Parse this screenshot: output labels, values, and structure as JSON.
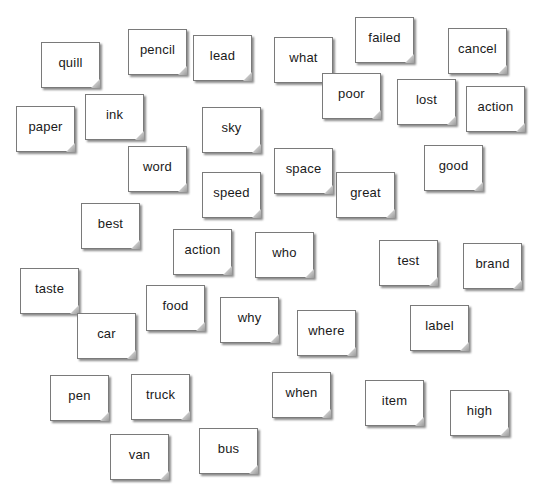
{
  "board": {
    "cards": [
      {
        "word": "quill",
        "x": 41,
        "y": 42
      },
      {
        "word": "pencil",
        "x": 128,
        "y": 29
      },
      {
        "word": "lead",
        "x": 193,
        "y": 35
      },
      {
        "word": "what",
        "x": 274,
        "y": 37
      },
      {
        "word": "failed",
        "x": 355,
        "y": 17
      },
      {
        "word": "cancel",
        "x": 448,
        "y": 28
      },
      {
        "word": "paper",
        "x": 16,
        "y": 106
      },
      {
        "word": "ink",
        "x": 85,
        "y": 94
      },
      {
        "word": "poor",
        "x": 322,
        "y": 73
      },
      {
        "word": "lost",
        "x": 397,
        "y": 79
      },
      {
        "word": "action",
        "x": 466,
        "y": 86
      },
      {
        "word": "sky",
        "x": 202,
        "y": 107
      },
      {
        "word": "word",
        "x": 128,
        "y": 146
      },
      {
        "word": "space",
        "x": 274,
        "y": 148
      },
      {
        "word": "good",
        "x": 424,
        "y": 145
      },
      {
        "word": "speed",
        "x": 202,
        "y": 172
      },
      {
        "word": "great",
        "x": 336,
        "y": 172
      },
      {
        "word": "best",
        "x": 81,
        "y": 203
      },
      {
        "word": "action",
        "x": 173,
        "y": 229
      },
      {
        "word": "who",
        "x": 255,
        "y": 232
      },
      {
        "word": "test",
        "x": 379,
        "y": 240
      },
      {
        "word": "brand",
        "x": 463,
        "y": 243
      },
      {
        "word": "taste",
        "x": 20,
        "y": 268
      },
      {
        "word": "food",
        "x": 146,
        "y": 285
      },
      {
        "word": "why",
        "x": 220,
        "y": 297
      },
      {
        "word": "car",
        "x": 77,
        "y": 313
      },
      {
        "word": "where",
        "x": 297,
        "y": 310
      },
      {
        "word": "label",
        "x": 410,
        "y": 305
      },
      {
        "word": "pen",
        "x": 50,
        "y": 375
      },
      {
        "word": "truck",
        "x": 131,
        "y": 374
      },
      {
        "word": "when",
        "x": 272,
        "y": 372
      },
      {
        "word": "item",
        "x": 365,
        "y": 380
      },
      {
        "word": "high",
        "x": 450,
        "y": 390
      },
      {
        "word": "van",
        "x": 110,
        "y": 434
      },
      {
        "word": "bus",
        "x": 199,
        "y": 428
      }
    ]
  },
  "colors": {
    "background": "#ffffff",
    "card_fill": "#ffffff",
    "card_border": "#7a7a7a",
    "text": "#1a1a1a"
  }
}
